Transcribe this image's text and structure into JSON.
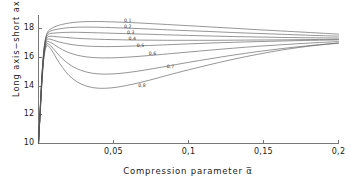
{
  "chart_data": {
    "type": "line",
    "title": "",
    "xlabel": "Compression  parameter  α̅",
    "ylabel": "Long axis−short axis a−c, km",
    "xlim": [
      0,
      0.2
    ],
    "ylim": [
      10,
      19
    ],
    "xticks": [
      0.05,
      0.1,
      0.15,
      0.2
    ],
    "xticklabels": [
      "0,05",
      "0,1",
      "0,15",
      "0,2"
    ],
    "yticks": [
      12,
      14,
      16,
      18
    ],
    "yticklabels": [
      "12",
      "14",
      "16",
      "18"
    ],
    "grid": false,
    "legend": "inline-curve-labels",
    "axis_color": "#777777",
    "curve_color": "#555555",
    "background": "#ffffff",
    "series": [
      {
        "name": "0,1",
        "label": "0,1",
        "label_x": 0.0595,
        "label_y": 18.62,
        "points": [
          [
            0.0,
            10.0
          ],
          [
            0.0012,
            12.6
          ],
          [
            0.0022,
            14.6
          ],
          [
            0.0032,
            16.1
          ],
          [
            0.0042,
            17.05
          ],
          [
            0.0052,
            17.55
          ],
          [
            0.0062,
            17.8
          ],
          [
            0.0075,
            17.95
          ],
          [
            0.009,
            18.05
          ],
          [
            0.011,
            18.15
          ],
          [
            0.014,
            18.26
          ],
          [
            0.018,
            18.36
          ],
          [
            0.023,
            18.44
          ],
          [
            0.029,
            18.49
          ],
          [
            0.036,
            18.51
          ],
          [
            0.044,
            18.5
          ],
          [
            0.053,
            18.47
          ],
          [
            0.063,
            18.43
          ],
          [
            0.074,
            18.37
          ],
          [
            0.086,
            18.3
          ],
          [
            0.1,
            18.22
          ],
          [
            0.115,
            18.13
          ],
          [
            0.13,
            18.04
          ],
          [
            0.146,
            17.94
          ],
          [
            0.162,
            17.85
          ],
          [
            0.178,
            17.76
          ],
          [
            0.19,
            17.69
          ],
          [
            0.2,
            17.63
          ]
        ]
      },
      {
        "name": "0,2",
        "label": "0,2",
        "label_x": 0.0595,
        "label_y": 18.22,
        "points": [
          [
            0.0,
            10.0
          ],
          [
            0.0012,
            12.55
          ],
          [
            0.0022,
            14.55
          ],
          [
            0.0032,
            16.05
          ],
          [
            0.0042,
            17.0
          ],
          [
            0.0052,
            17.48
          ],
          [
            0.0062,
            17.7
          ],
          [
            0.0075,
            17.82
          ],
          [
            0.009,
            17.88
          ],
          [
            0.011,
            17.94
          ],
          [
            0.014,
            18.0
          ],
          [
            0.018,
            18.06
          ],
          [
            0.023,
            18.1
          ],
          [
            0.029,
            18.12
          ],
          [
            0.036,
            18.12
          ],
          [
            0.044,
            18.1
          ],
          [
            0.053,
            18.07
          ],
          [
            0.063,
            18.03
          ],
          [
            0.074,
            17.99
          ],
          [
            0.086,
            17.93
          ],
          [
            0.1,
            17.87
          ],
          [
            0.115,
            17.81
          ],
          [
            0.13,
            17.74
          ],
          [
            0.146,
            17.68
          ],
          [
            0.162,
            17.62
          ],
          [
            0.178,
            17.56
          ],
          [
            0.19,
            17.52
          ],
          [
            0.2,
            17.49
          ]
        ]
      },
      {
        "name": "0,3",
        "label": "0,3",
        "label_x": 0.0615,
        "label_y": 17.8,
        "points": [
          [
            0.0,
            10.0
          ],
          [
            0.0012,
            12.5
          ],
          [
            0.0022,
            14.48
          ],
          [
            0.0032,
            15.98
          ],
          [
            0.0042,
            16.92
          ],
          [
            0.0052,
            17.38
          ],
          [
            0.0062,
            17.58
          ],
          [
            0.0075,
            17.66
          ],
          [
            0.009,
            17.69
          ],
          [
            0.011,
            17.71
          ],
          [
            0.014,
            17.73
          ],
          [
            0.018,
            17.75
          ],
          [
            0.023,
            17.76
          ],
          [
            0.029,
            17.75
          ],
          [
            0.036,
            17.73
          ],
          [
            0.044,
            17.71
          ],
          [
            0.053,
            17.68
          ],
          [
            0.063,
            17.65
          ],
          [
            0.074,
            17.62
          ],
          [
            0.086,
            17.58
          ],
          [
            0.1,
            17.54
          ],
          [
            0.115,
            17.5
          ],
          [
            0.13,
            17.46
          ],
          [
            0.146,
            17.43
          ],
          [
            0.162,
            17.4
          ],
          [
            0.178,
            17.38
          ],
          [
            0.19,
            17.37
          ],
          [
            0.2,
            17.36
          ]
        ]
      },
      {
        "name": "0,4",
        "label": "0,4",
        "label_x": 0.0625,
        "label_y": 17.38,
        "points": [
          [
            0.0,
            10.0
          ],
          [
            0.0012,
            12.45
          ],
          [
            0.0022,
            14.42
          ],
          [
            0.0032,
            15.9
          ],
          [
            0.0042,
            16.82
          ],
          [
            0.0052,
            17.26
          ],
          [
            0.0062,
            17.44
          ],
          [
            0.0075,
            17.48
          ],
          [
            0.009,
            17.48
          ],
          [
            0.011,
            17.46
          ],
          [
            0.014,
            17.43
          ],
          [
            0.018,
            17.4
          ],
          [
            0.023,
            17.36
          ],
          [
            0.029,
            17.32
          ],
          [
            0.036,
            17.29
          ],
          [
            0.044,
            17.26
          ],
          [
            0.053,
            17.24
          ],
          [
            0.063,
            17.22
          ],
          [
            0.074,
            17.21
          ],
          [
            0.086,
            17.2
          ],
          [
            0.1,
            17.2
          ],
          [
            0.115,
            17.2
          ],
          [
            0.13,
            17.21
          ],
          [
            0.146,
            17.22
          ],
          [
            0.162,
            17.23
          ],
          [
            0.178,
            17.25
          ],
          [
            0.19,
            17.26
          ],
          [
            0.2,
            17.27
          ]
        ]
      },
      {
        "name": "0,5",
        "label": "0,5",
        "label_x": 0.068,
        "label_y": 16.88,
        "points": [
          [
            0.0,
            10.0
          ],
          [
            0.0012,
            12.4
          ],
          [
            0.0022,
            14.36
          ],
          [
            0.0032,
            15.82
          ],
          [
            0.0042,
            16.72
          ],
          [
            0.0052,
            17.14
          ],
          [
            0.0062,
            17.28
          ],
          [
            0.0075,
            17.28
          ],
          [
            0.009,
            17.24
          ],
          [
            0.011,
            17.17
          ],
          [
            0.014,
            17.08
          ],
          [
            0.018,
            16.98
          ],
          [
            0.023,
            16.89
          ],
          [
            0.029,
            16.82
          ],
          [
            0.036,
            16.78
          ],
          [
            0.044,
            16.76
          ],
          [
            0.053,
            16.77
          ],
          [
            0.063,
            16.8
          ],
          [
            0.074,
            16.84
          ],
          [
            0.086,
            16.89
          ],
          [
            0.1,
            16.95
          ],
          [
            0.115,
            17.01
          ],
          [
            0.13,
            17.06
          ],
          [
            0.146,
            17.11
          ],
          [
            0.162,
            17.15
          ],
          [
            0.178,
            17.19
          ],
          [
            0.19,
            17.21
          ],
          [
            0.2,
            17.23
          ]
        ]
      },
      {
        "name": "0,6",
        "label": "0,6",
        "label_x": 0.076,
        "label_y": 16.3,
        "points": [
          [
            0.0,
            10.0
          ],
          [
            0.0012,
            12.34
          ],
          [
            0.0022,
            14.28
          ],
          [
            0.0032,
            15.74
          ],
          [
            0.0042,
            16.62
          ],
          [
            0.0052,
            17.0
          ],
          [
            0.0062,
            17.12
          ],
          [
            0.0075,
            17.08
          ],
          [
            0.009,
            17.0
          ],
          [
            0.011,
            16.86
          ],
          [
            0.014,
            16.66
          ],
          [
            0.018,
            16.44
          ],
          [
            0.023,
            16.24
          ],
          [
            0.029,
            16.09
          ],
          [
            0.036,
            16.0
          ],
          [
            0.044,
            15.97
          ],
          [
            0.053,
            15.99
          ],
          [
            0.063,
            16.05
          ],
          [
            0.074,
            16.14
          ],
          [
            0.086,
            16.25
          ],
          [
            0.1,
            16.38
          ],
          [
            0.115,
            16.52
          ],
          [
            0.13,
            16.65
          ],
          [
            0.146,
            16.78
          ],
          [
            0.162,
            16.89
          ],
          [
            0.178,
            16.99
          ],
          [
            0.19,
            17.06
          ],
          [
            0.2,
            17.11
          ]
        ]
      },
      {
        "name": "0,7",
        "label": "0,7",
        "label_x": 0.088,
        "label_y": 15.42,
        "points": [
          [
            0.0,
            10.0
          ],
          [
            0.0012,
            12.28
          ],
          [
            0.0022,
            14.2
          ],
          [
            0.0032,
            15.66
          ],
          [
            0.0042,
            16.52
          ],
          [
            0.0052,
            16.88
          ],
          [
            0.0062,
            16.96
          ],
          [
            0.0075,
            16.88
          ],
          [
            0.009,
            16.72
          ],
          [
            0.011,
            16.48
          ],
          [
            0.014,
            16.12
          ],
          [
            0.018,
            15.72
          ],
          [
            0.023,
            15.36
          ],
          [
            0.029,
            15.08
          ],
          [
            0.036,
            14.9
          ],
          [
            0.044,
            14.84
          ],
          [
            0.053,
            14.88
          ],
          [
            0.063,
            15.0
          ],
          [
            0.074,
            15.18
          ],
          [
            0.086,
            15.4
          ],
          [
            0.1,
            15.66
          ],
          [
            0.115,
            15.92
          ],
          [
            0.13,
            16.17
          ],
          [
            0.146,
            16.41
          ],
          [
            0.162,
            16.62
          ],
          [
            0.178,
            16.8
          ],
          [
            0.19,
            16.92
          ],
          [
            0.2,
            17.01
          ]
        ]
      },
      {
        "name": "0,8",
        "label": "0,8",
        "label_x": 0.069,
        "label_y": 14.1,
        "points": [
          [
            0.0,
            10.0
          ],
          [
            0.0012,
            12.22
          ],
          [
            0.0022,
            14.12
          ],
          [
            0.0032,
            15.58
          ],
          [
            0.0042,
            16.42
          ],
          [
            0.0052,
            16.76
          ],
          [
            0.0062,
            16.82
          ],
          [
            0.0075,
            16.7
          ],
          [
            0.009,
            16.48
          ],
          [
            0.011,
            16.12
          ],
          [
            0.014,
            15.6
          ],
          [
            0.018,
            15.02
          ],
          [
            0.023,
            14.5
          ],
          [
            0.029,
            14.12
          ],
          [
            0.036,
            13.9
          ],
          [
            0.044,
            13.85
          ],
          [
            0.053,
            13.94
          ],
          [
            0.063,
            14.14
          ],
          [
            0.074,
            14.42
          ],
          [
            0.086,
            14.76
          ],
          [
            0.1,
            15.14
          ],
          [
            0.115,
            15.52
          ],
          [
            0.13,
            15.88
          ],
          [
            0.146,
            16.22
          ],
          [
            0.162,
            16.52
          ],
          [
            0.178,
            16.76
          ],
          [
            0.19,
            16.9
          ],
          [
            0.2,
            17.0
          ]
        ]
      }
    ]
  }
}
